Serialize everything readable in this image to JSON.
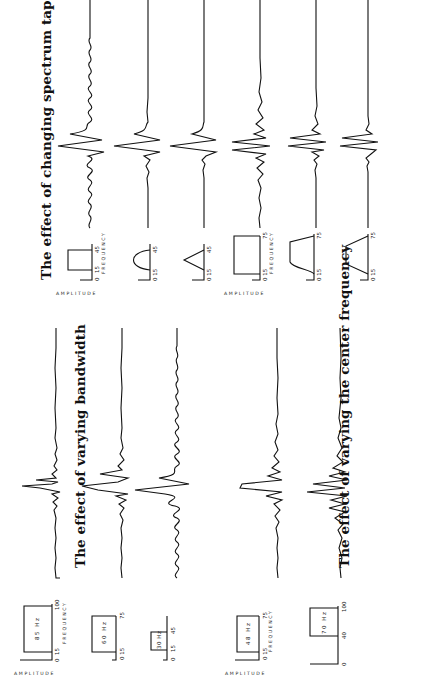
{
  "panels": [
    {
      "id": "bandwidth",
      "title": "The effect of varying bandwidth",
      "axis_labels": {
        "y": "AMPLITUDE",
        "x": "FREQUENCY"
      },
      "rows": [
        {
          "shape": "box",
          "bandwidth_label": "85 Hz",
          "ticks": [
            "0",
            "15",
            "100"
          ],
          "f_low": 15,
          "f_high": 100,
          "f_max": 100
        },
        {
          "shape": "box",
          "bandwidth_label": "60 Hz",
          "ticks": [
            "0 15",
            "75"
          ],
          "f_low": 15,
          "f_high": 75,
          "f_max": 100
        },
        {
          "shape": "box",
          "bandwidth_label": "30 Hz",
          "ticks": [
            "0",
            "15",
            "45"
          ],
          "f_low": 15,
          "f_high": 45,
          "f_max": 100
        }
      ]
    },
    {
      "id": "center-frequency",
      "title": "The effect of varying the center frequency",
      "axis_labels": {
        "y": "AMPLITUDE",
        "x": "FREQUENCY"
      },
      "rows": [
        {
          "shape": "box",
          "bandwidth_label": "48 Hz",
          "ticks": [
            "0 15",
            "75"
          ],
          "f_low": 15,
          "f_high": 75,
          "f_max": 100
        },
        {
          "shape": "box",
          "bandwidth_label": "70 Hz",
          "ticks": [
            "0",
            "40",
            "100"
          ],
          "f_low": 40,
          "f_high": 100,
          "f_max": 100
        }
      ]
    },
    {
      "id": "spectrum-taper",
      "title": "The effect of changing spectrum taper",
      "axis_labels": {
        "y": "AMPLITUDE",
        "x": "FREQUENCY"
      },
      "rows": [
        {
          "shape": "box",
          "ticks": [
            "0",
            "15",
            "45"
          ],
          "f_low": 15,
          "f_high": 45
        },
        {
          "shape": "arch",
          "ticks": [
            "0 15",
            "45"
          ],
          "f_low": 15,
          "f_high": 45
        },
        {
          "shape": "triangle",
          "ticks": [
            "0 15",
            "45"
          ],
          "f_low": 15,
          "f_high": 45
        },
        {
          "shape": "box",
          "ticks": [
            "0 15",
            "75"
          ],
          "f_low": 15,
          "f_high": 75
        },
        {
          "shape": "rounded-trapezoid",
          "ticks": [
            "0 15",
            "75"
          ],
          "f_low": 15,
          "f_high": 75
        },
        {
          "shape": "trapezoid",
          "ticks": [
            "0 15",
            "75"
          ],
          "f_low": 15,
          "f_high": 75
        }
      ]
    }
  ],
  "colors": {
    "ink": "#111111",
    "paper": "#ffffff"
  }
}
